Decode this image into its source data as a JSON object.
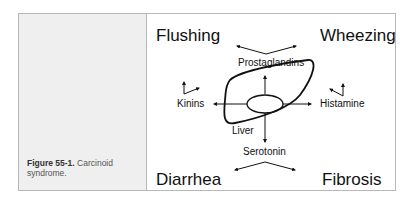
{
  "figure": {
    "label": "Figure 55-1.",
    "caption": " Carcinoid syndrome.",
    "colors": {
      "panel_bg": "#efefef",
      "border": "#b8b8b8",
      "ink": "#111111"
    }
  },
  "diagram": {
    "center": "Liver",
    "mediators": [
      "Prostaglandins",
      "Kinins",
      "Histamine",
      "Serotonin"
    ],
    "symptoms": {
      "top_left": "Flushing",
      "top_right": "Wheezing",
      "bottom_left": "Diarrhea",
      "bottom_right": "Fibrosis"
    }
  }
}
